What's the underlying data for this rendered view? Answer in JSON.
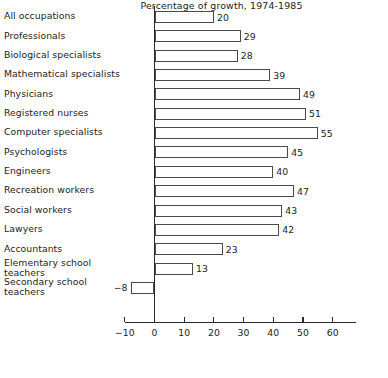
{
  "chart_data": {
    "type": "bar",
    "orientation": "horizontal",
    "title": "",
    "subtitle": "",
    "xlabel": "Percentage of growth, 1974-1985",
    "ylabel": "",
    "xlim": [
      -10,
      68
    ],
    "xticks": [
      -10,
      0,
      10,
      20,
      30,
      40,
      50,
      60
    ],
    "xtick_labels": [
      "−10",
      "0",
      "10",
      "20",
      "30",
      "40",
      "50",
      "60"
    ],
    "grid": false,
    "legend": null,
    "bar_fill_color": "#ffffff",
    "bar_edge_color": "#4a4a4a",
    "axis_color": "#2a2a2a",
    "categories": [
      "All occupations",
      "Professionals",
      "Biological specialists",
      "Mathematical specialists",
      "Physicians",
      "Registered nurses",
      "Computer specialists",
      "Psychologists",
      "Engineers",
      "Recreation workers",
      "Social workers",
      "Lawyers",
      "Accountants",
      "Elementary school\nteachers",
      "Secondary school\nteachers"
    ],
    "values": [
      20,
      29,
      28,
      39,
      49,
      51,
      55,
      45,
      40,
      47,
      43,
      42,
      23,
      13,
      -8
    ],
    "value_labels": [
      "20",
      "29",
      "28",
      "39",
      "49",
      "51",
      "55",
      "45",
      "40",
      "47",
      "43",
      "42",
      "23",
      "13",
      "−8"
    ],
    "bars": [
      {
        "category": "All occupations",
        "value": 20,
        "label": "20"
      },
      {
        "category": "Professionals",
        "value": 29,
        "label": "29"
      },
      {
        "category": "Biological specialists",
        "value": 28,
        "label": "28"
      },
      {
        "category": "Mathematical specialists",
        "value": 39,
        "label": "39"
      },
      {
        "category": "Physicians",
        "value": 49,
        "label": "49"
      },
      {
        "category": "Registered nurses",
        "value": 51,
        "label": "51"
      },
      {
        "category": "Computer specialists",
        "value": 55,
        "label": "55"
      },
      {
        "category": "Psychologists",
        "value": 45,
        "label": "45"
      },
      {
        "category": "Engineers",
        "value": 40,
        "label": "40"
      },
      {
        "category": "Recreation workers",
        "value": 47,
        "label": "47"
      },
      {
        "category": "Social workers",
        "value": 43,
        "label": "43"
      },
      {
        "category": "Lawyers",
        "value": 42,
        "label": "42"
      },
      {
        "category": "Accountants",
        "value": 23,
        "label": "23"
      },
      {
        "category": "Elementary school teachers",
        "value": 13,
        "label": "13"
      },
      {
        "category": "Secondary school teachers",
        "value": -8,
        "label": "−8"
      }
    ]
  },
  "axis": {
    "caption": "Percentage of growth, 1974-1985"
  }
}
